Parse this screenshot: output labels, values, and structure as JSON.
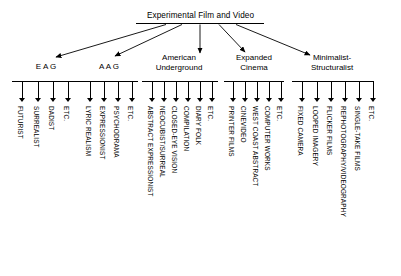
{
  "diagram": {
    "type": "tree",
    "root": {
      "label": "Experimental Film and Video"
    },
    "groups": [
      {
        "id": "eag",
        "label": "E A G",
        "label_lines": [
          "E A G"
        ],
        "leaves": [
          {
            "label": "FUTURIST"
          },
          {
            "label": "SURREALIST"
          },
          {
            "label": "DADIST"
          },
          {
            "label": "ETC."
          }
        ]
      },
      {
        "id": "aag",
        "label": "A A G",
        "label_lines": [
          "A A G"
        ],
        "leaves": [
          {
            "label": "LYRIC REALISM"
          },
          {
            "label": "EXPRESSIONIST"
          },
          {
            "label": "PSYCHODRAMA"
          },
          {
            "label": "ETC."
          }
        ]
      },
      {
        "id": "american-underground",
        "label": "American Underground",
        "label_lines": [
          "American",
          "Underground"
        ],
        "leaves": [
          {
            "label": "ABSTRACT EXPRESSIONIST"
          },
          {
            "label": "NEOCUBIST/SURREAL"
          },
          {
            "label": "CLOSED-EYE VISION"
          },
          {
            "label": "COMPILATION"
          },
          {
            "label": "DIARY  FOLK"
          },
          {
            "label": "ETC."
          }
        ]
      },
      {
        "id": "expanded-cinema",
        "label": "Expanded Cinema",
        "label_lines": [
          "Expanded",
          "Cinema"
        ],
        "leaves": [
          {
            "label": "PRINTER FILMS"
          },
          {
            "label": "CINEVIDEO"
          },
          {
            "label": "WEST COAST ABSTRACT"
          },
          {
            "label": "COMPUTER  WORKS"
          },
          {
            "label": "ETC."
          }
        ]
      },
      {
        "id": "minimalist-structuralist",
        "label": "Minimalist-Structuralist",
        "label_lines": [
          "Minimalist-",
          "Structuralist"
        ],
        "leaves": [
          {
            "label": "FIXED CAMERA"
          },
          {
            "label": "LOOPED IMAGERY"
          },
          {
            "label": "FLICKER FILMS"
          },
          {
            "label": "REPHOTOGRAPHY/VIDEOGRAPHY"
          },
          {
            "label": "SINGLE-TAKE  FILMS"
          },
          {
            "label": "ETC."
          }
        ]
      }
    ],
    "colors": {
      "line": "#000000",
      "text": "#000000",
      "background": "#ffffff"
    }
  }
}
